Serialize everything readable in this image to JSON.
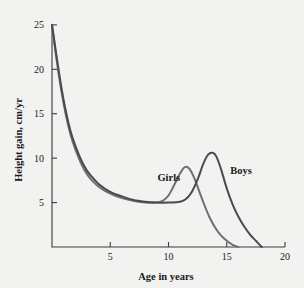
{
  "chart_data": {
    "type": "line",
    "title": "",
    "xlabel": "Age in years",
    "ylabel": "Height gain, cm/yr",
    "xlim": [
      0,
      20
    ],
    "ylim": [
      0,
      26
    ],
    "xticks": [
      5,
      10,
      15,
      20
    ],
    "yticks": [
      5,
      10,
      15,
      20,
      25
    ],
    "xtick_labels": [
      "5",
      "10",
      "15",
      "20"
    ],
    "ytick_labels": [
      "5",
      "10",
      "15",
      "20",
      "25"
    ],
    "grid": false,
    "legend_position": "inline-annotations",
    "series": [
      {
        "name": "Girls",
        "color": "#6e6e74",
        "label_x": 11.0,
        "label_y": 7.4,
        "x": [
          0,
          0.4,
          0.8,
          1.2,
          1.6,
          2.0,
          2.5,
          3.0,
          3.5,
          4.0,
          5.0,
          6.0,
          7.0,
          8.0,
          9.0,
          9.5,
          10.0,
          10.5,
          11.0,
          11.4,
          11.8,
          12.2,
          12.6,
          13.0,
          13.5,
          14.0,
          14.5,
          15.0,
          15.5,
          16.0
        ],
        "y": [
          25.0,
          21.0,
          17.6,
          14.8,
          12.6,
          11.0,
          9.4,
          8.2,
          7.4,
          6.8,
          6.0,
          5.5,
          5.2,
          5.0,
          5.0,
          5.2,
          5.8,
          7.0,
          8.3,
          9.0,
          8.8,
          7.8,
          6.4,
          5.0,
          3.4,
          2.2,
          1.3,
          0.7,
          0.25,
          0.0
        ]
      },
      {
        "name": "Boys",
        "color": "#4a4a50",
        "label_x": 15.3,
        "label_y": 8.2,
        "x": [
          0,
          0.4,
          0.8,
          1.2,
          1.6,
          2.0,
          2.5,
          3.0,
          3.5,
          4.0,
          5.0,
          6.0,
          7.0,
          8.0,
          9.0,
          10.0,
          11.0,
          11.5,
          12.0,
          12.5,
          13.0,
          13.4,
          13.8,
          14.1,
          14.5,
          15.0,
          15.5,
          16.0,
          16.5,
          17.0,
          17.5,
          18.0
        ],
        "y": [
          25.0,
          21.4,
          18.0,
          15.2,
          13.0,
          11.4,
          9.8,
          8.6,
          7.8,
          7.1,
          6.2,
          5.7,
          5.3,
          5.1,
          5.0,
          5.0,
          5.1,
          5.4,
          6.2,
          7.6,
          9.4,
          10.4,
          10.6,
          10.2,
          8.8,
          6.6,
          4.8,
          3.4,
          2.3,
          1.4,
          0.7,
          0.0
        ]
      }
    ]
  },
  "colors": {
    "background": "#f2f2f0",
    "axis": "#3a3a3a",
    "text": "#1a1a1a",
    "girls_curve": "#6e6e74",
    "boys_curve": "#4a4a50"
  }
}
